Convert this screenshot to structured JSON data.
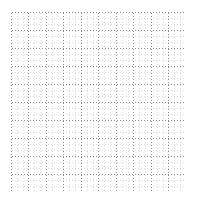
{
  "canvas": {
    "width": 197,
    "height": 202,
    "background_color": "#ffffff"
  },
  "grid": {
    "name": "dotted-graph-paper",
    "origin_x": 11,
    "origin_y": 12,
    "width": 175,
    "height": 180,
    "major_step_x": 17.5,
    "major_step_y": 18.0,
    "major_columns": 10,
    "major_rows": 10,
    "minor_per_major": 3,
    "minor_step_x": 5.8333,
    "minor_step_y": 6.0,
    "minor_columns": 30,
    "minor_rows": 30,
    "minor_color": "#d9d9d9",
    "major_color": "#8c8c8c",
    "border_color": "#8c8c8c",
    "line_style": "dotted",
    "dash_pattern": "1 2",
    "line_width": 1,
    "has_border": true,
    "has_labels": false,
    "has_axis_ticks": false,
    "has_legend": false
  },
  "chart_data": {
    "type": "table",
    "title": "",
    "subtitle": "",
    "xlabel": "",
    "ylabel": "",
    "categories": [],
    "values": [],
    "series": [],
    "annotations": [],
    "legend_position": "none",
    "grid": "on"
  }
}
